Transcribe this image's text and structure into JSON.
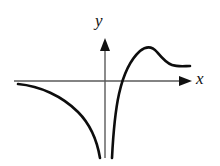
{
  "figure": {
    "name": "function-graph",
    "background_color": "#ffffff",
    "curve_color": "#0d0d0d",
    "axis_color": "#5a5a5a",
    "width": 220,
    "height": 166
  },
  "axes": {
    "x_label": "x",
    "y_label": "y",
    "x_axis": {
      "start_x": 14,
      "end_x": 192,
      "y": 81,
      "arrow": "right-arrowhead"
    },
    "y_axis": {
      "x": 105,
      "top_y": 38,
      "bottom_y": 158,
      "arrow": "up-arrowhead"
    },
    "origin": {
      "x": 105,
      "y": 81
    },
    "grid": false,
    "tick_labels": []
  },
  "chart_data": {
    "type": "line",
    "title": "",
    "subtitle": "",
    "xlabel": "x",
    "ylabel": "y",
    "xlim": [
      14,
      192
    ],
    "ylim": [
      38,
      158
    ],
    "grid": false,
    "legend": false,
    "annotations": [],
    "features": {
      "vertical_asymptote_x": 0,
      "horizontal_asymptote_right": "approaches constant positive value",
      "x_intercept": 122,
      "local_maximum": {
        "x": 145,
        "y": 47
      },
      "left_branch_behavior": "decreases from just below x-axis toward negative infinity as x approaches 0 from the left",
      "right_branch_behavior": "rises from negative infinity near x=0, crosses x-axis, peaks, then decays to a horizontal asymptote"
    },
    "series": [
      {
        "name": "left-branch",
        "path": "M 18,84 C 40,86 62,96 78,112 C 90,124 97,140 100,158"
      },
      {
        "name": "right-branch",
        "path": "M 112,158 C 113,138 115,112 119,94 C 123,76 130,60 140,51 C 146,46 152,46 157,52 C 162,58 166,63 172,65 C 178,67 185,66 190,66"
      }
    ]
  }
}
